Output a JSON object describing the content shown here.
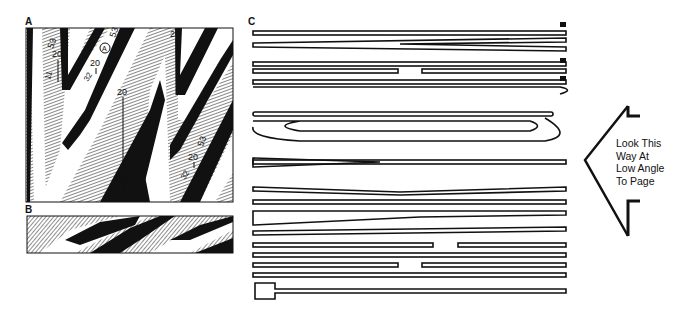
{
  "figure": {
    "panels": [
      {
        "id": "A",
        "label": "A",
        "description": "Zigzag fold pattern map with black, hatched and white bands",
        "annotations": [
          "53",
          "Ⓐ",
          "20",
          "11",
          "32",
          "20",
          "20",
          "20",
          "53",
          "32"
        ]
      },
      {
        "id": "B",
        "label": "B",
        "description": "Cross-section strip of zigzag folded layers"
      },
      {
        "id": "C",
        "label": "C",
        "description": "Stacked outlined horizontal bars forming folded layers (view at low angle)"
      }
    ],
    "caption": {
      "lines": [
        "Look This",
        "Way At",
        "Low Angle",
        "To Page"
      ]
    },
    "colors": {
      "ink": "#111111",
      "hatch": "#9a9a9a",
      "paper": "#ffffff"
    }
  }
}
